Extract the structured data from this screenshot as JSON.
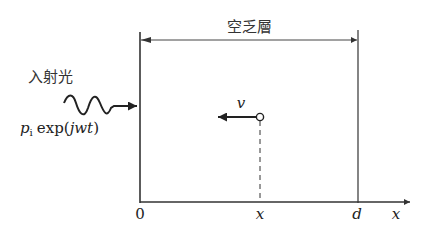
{
  "title_label": "空乏層",
  "incident_light_label": "入射光",
  "incident_expr": {
    "p": "p",
    "sub": "i",
    "func": "exp",
    "open": "(",
    "arg": "jwt",
    "close": ")"
  },
  "velocity_label": "v",
  "axis": {
    "origin_label": "0",
    "position_label": "x",
    "width_label": "d",
    "axis_label": "x"
  },
  "colors": {
    "line": "#333333",
    "background": "#ffffff"
  }
}
